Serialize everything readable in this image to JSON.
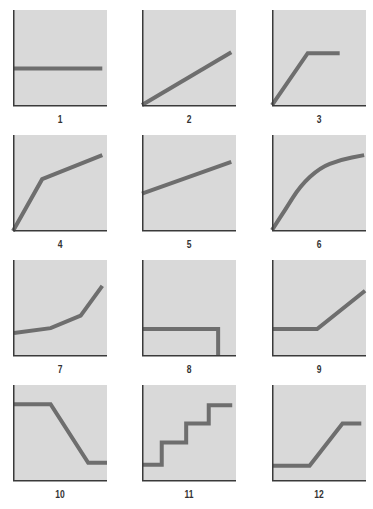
{
  "figure": {
    "colors": {
      "panel_background": "#d9d9d9",
      "line": "#6e6e6e",
      "axis": "#3a3a3a",
      "label": "#333333",
      "page_background": "#ffffff"
    }
  },
  "chart_data": [
    {
      "type": "line",
      "title": "1",
      "xlim": [
        0,
        100
      ],
      "ylim": [
        0,
        100
      ],
      "grid": false,
      "shape": "horizontal constant",
      "x": [
        0,
        95
      ],
      "y": [
        39,
        39
      ]
    },
    {
      "type": "line",
      "title": "2",
      "xlim": [
        0,
        100
      ],
      "ylim": [
        0,
        100
      ],
      "grid": false,
      "shape": "linear increase from origin",
      "x": [
        0,
        95
      ],
      "y": [
        1,
        56
      ]
    },
    {
      "type": "line",
      "title": "3",
      "xlim": [
        0,
        100
      ],
      "ylim": [
        0,
        100
      ],
      "grid": false,
      "shape": "steep rise then plateau",
      "x": [
        0,
        38,
        72
      ],
      "y": [
        1,
        55,
        55
      ]
    },
    {
      "type": "line",
      "title": "4",
      "xlim": [
        0,
        100
      ],
      "ylim": [
        0,
        100
      ],
      "grid": false,
      "shape": "steep rise then gentler rise",
      "x": [
        0,
        31,
        95
      ],
      "y": [
        0,
        54,
        79
      ]
    },
    {
      "type": "line",
      "title": "5",
      "xlim": [
        0,
        100
      ],
      "ylim": [
        0,
        100
      ],
      "grid": false,
      "shape": "linear increase with positive intercept",
      "x": [
        0,
        95
      ],
      "y": [
        39,
        72
      ]
    },
    {
      "type": "line",
      "title": "6",
      "xlim": [
        0,
        100
      ],
      "ylim": [
        0,
        100
      ],
      "grid": false,
      "shape": "concave curve (diminishing growth)",
      "curve": true,
      "x": [
        0,
        14,
        30,
        51,
        72,
        98
      ],
      "y": [
        1,
        22,
        47,
        66,
        74,
        79
      ]
    },
    {
      "type": "line",
      "title": "7",
      "xlim": [
        0,
        100
      ],
      "ylim": [
        0,
        100
      ],
      "grid": false,
      "shape": "accelerating growth (piecewise)",
      "x": [
        1,
        40,
        72,
        95
      ],
      "y": [
        24,
        29,
        42,
        73
      ]
    },
    {
      "type": "line",
      "title": "8",
      "xlim": [
        0,
        100
      ],
      "ylim": [
        0,
        100
      ],
      "grid": false,
      "shape": "constant then sudden drop to zero",
      "x": [
        0,
        81,
        81
      ],
      "y": [
        28,
        28,
        0
      ]
    },
    {
      "type": "line",
      "title": "9",
      "xlim": [
        0,
        100
      ],
      "ylim": [
        0,
        100
      ],
      "grid": false,
      "shape": "flat then linear increase",
      "x": [
        0,
        48,
        99
      ],
      "y": [
        28,
        28,
        68
      ]
    },
    {
      "type": "line",
      "title": "10",
      "xlim": [
        0,
        100
      ],
      "ylim": [
        0,
        100
      ],
      "grid": false,
      "shape": "high plateau, decline, low plateau",
      "x": [
        0,
        40,
        80,
        100
      ],
      "y": [
        80,
        80,
        19,
        19
      ]
    },
    {
      "type": "line",
      "title": "11",
      "xlim": [
        0,
        100
      ],
      "ylim": [
        0,
        100
      ],
      "grid": false,
      "shape": "step function (staircase)",
      "x": [
        0,
        21,
        21,
        47,
        47,
        71,
        71,
        96
      ],
      "y": [
        17,
        17,
        40,
        40,
        60,
        60,
        79,
        79
      ]
    },
    {
      "type": "line",
      "title": "12",
      "xlim": [
        0,
        100
      ],
      "ylim": [
        0,
        100
      ],
      "grid": false,
      "shape": "low plateau, rise, high plateau",
      "x": [
        0,
        40,
        75,
        95
      ],
      "y": [
        16,
        16,
        60,
        60
      ]
    }
  ],
  "panels": [
    {
      "label": "1",
      "left": 13,
      "top": 10
    },
    {
      "label": "2",
      "left": 142,
      "top": 10
    },
    {
      "label": "3",
      "left": 272,
      "top": 10
    },
    {
      "label": "4",
      "left": 13,
      "top": 135
    },
    {
      "label": "5",
      "left": 142,
      "top": 135
    },
    {
      "label": "6",
      "left": 272,
      "top": 135
    },
    {
      "label": "7",
      "left": 13,
      "top": 260
    },
    {
      "label": "8",
      "left": 142,
      "top": 260
    },
    {
      "label": "9",
      "left": 272,
      "top": 260
    },
    {
      "label": "10",
      "left": 13,
      "top": 385
    },
    {
      "label": "11",
      "left": 142,
      "top": 385
    },
    {
      "label": "12",
      "left": 272,
      "top": 385
    }
  ]
}
